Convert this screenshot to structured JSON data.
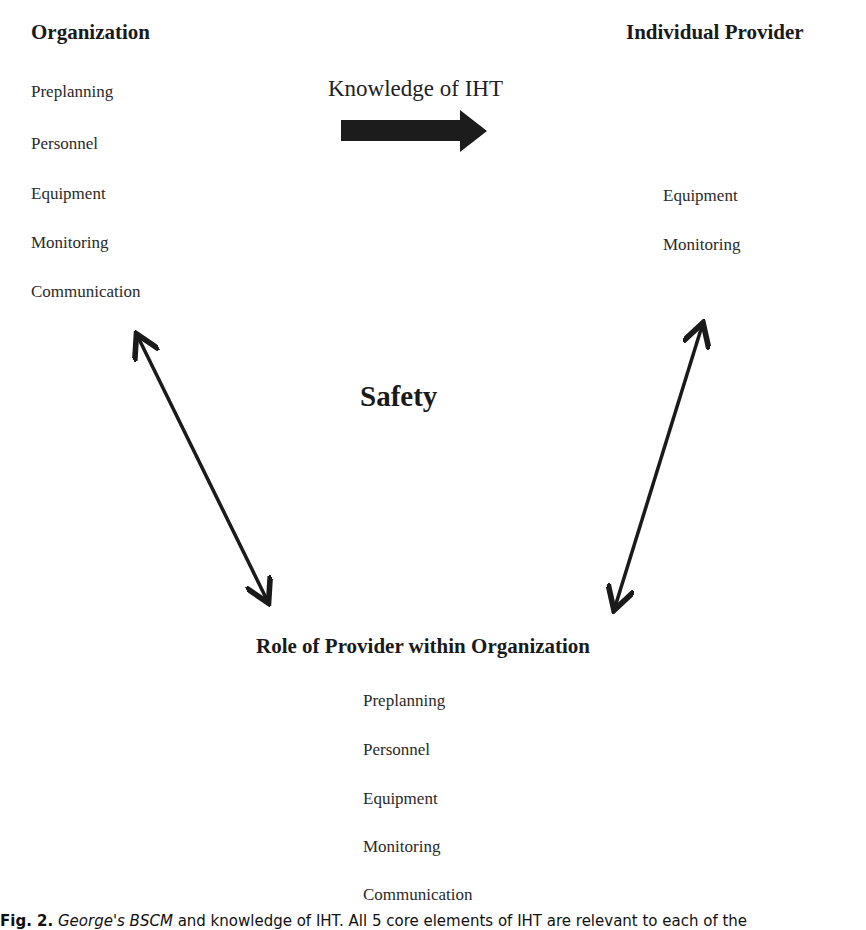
{
  "organization": {
    "heading": "Organization",
    "items": [
      "Preplanning",
      "Personnel",
      "Equipment",
      "Monitoring",
      "Communication"
    ]
  },
  "individual_provider": {
    "heading": "Individual Provider",
    "items": [
      "Equipment",
      "Monitoring"
    ]
  },
  "knowledge_arrow": {
    "label": "Knowledge of IHT",
    "icon": "right-block-arrow-icon"
  },
  "center": {
    "title": "Safety"
  },
  "role": {
    "heading": "Role of Provider within Organization",
    "items": [
      "Preplanning",
      "Personnel",
      "Equipment",
      "Monitoring",
      "Communication"
    ]
  },
  "connectors": [
    {
      "icon": "double-headed-arrow-icon",
      "from": "organization",
      "to": "role"
    },
    {
      "icon": "double-headed-arrow-icon",
      "from": "individual_provider",
      "to": "role"
    }
  ],
  "caption": {
    "fig": "Fig. 2.",
    "text_italic": "George's BSCM",
    "text": " and knowledge of IHT. All 5 core elements of IHT are relevant to each of the"
  }
}
